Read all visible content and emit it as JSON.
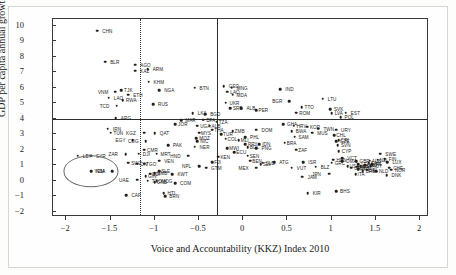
{
  "chart_data": {
    "type": "scatter",
    "title": "",
    "xlabel": "Voice and Accountability (KKZ) Index 2010",
    "ylabel": "GDP per capita annual growth (%), 2000–11",
    "xlim": [
      -2.15,
      2.1
    ],
    "ylim": [
      -2.35,
      10.45
    ],
    "xticks": [
      -2,
      -1.5,
      -1,
      -0.5,
      0,
      0.5,
      1,
      1.5,
      2
    ],
    "xticklabels": [
      "−2",
      "−1.5",
      "−1",
      "−0.5",
      "0",
      "0.5",
      "1",
      "1.5",
      "2"
    ],
    "yticks": [
      10,
      9,
      8,
      7,
      6,
      5,
      4,
      3,
      2,
      1,
      0,
      -1,
      -2
    ],
    "yticklabels": [
      "10",
      "9",
      "8",
      "7",
      "6",
      "5",
      "4",
      "3",
      "2",
      "1",
      "0",
      "−1",
      "−2"
    ],
    "grid": false,
    "legend": null,
    "reference_lines": [
      {
        "name": "growth-threshold-line",
        "orientation": "horizontal",
        "value": 4,
        "style": "solid"
      },
      {
        "name": "voice-index-line",
        "orientation": "vertical",
        "value": -0.3,
        "style": "solid"
      },
      {
        "name": "voice-index-lower-line",
        "orientation": "vertical",
        "value": -1.17,
        "style": "dotted"
      }
    ],
    "highlight": {
      "name": "KSA",
      "x": -1.72,
      "y": 0.6,
      "rx": 0.3,
      "ry": 0.95,
      "color": "#6a6a6a"
    },
    "points": [
      {
        "code": "CHN",
        "x": -1.65,
        "y": 9.7,
        "lx": 5
      },
      {
        "code": "BLR",
        "x": -1.56,
        "y": 7.7,
        "lx": 5
      },
      {
        "code": "AGO",
        "x": -1.22,
        "y": 7.5,
        "lx": 5
      },
      {
        "code": "KAZ",
        "x": -1.22,
        "y": 7.1,
        "lx": 5
      },
      {
        "code": "ARM",
        "x": -1.08,
        "y": 7.2,
        "lx": 5
      },
      {
        "code": "KHM",
        "x": -1.07,
        "y": 6.4,
        "lx": 5
      },
      {
        "code": "NGA",
        "x": -0.95,
        "y": 5.85,
        "lx": 5
      },
      {
        "code": "BTN",
        "x": -0.55,
        "y": 6.0,
        "lx": 5
      },
      {
        "code": "GEO",
        "x": -0.22,
        "y": 6.1,
        "lx": 5
      },
      {
        "code": "MNG",
        "x": -0.13,
        "y": 6.0,
        "lx": 5
      },
      {
        "code": "LAO_B",
        "label": "LAO",
        "x": -1.52,
        "y": 5.35,
        "lx": 5
      },
      {
        "code": "VNM",
        "x": -1.45,
        "y": 5.75,
        "lx": -17
      },
      {
        "code": "TJK",
        "x": -1.38,
        "y": 5.85,
        "lx": 3
      },
      {
        "code": "ETH",
        "x": -1.3,
        "y": 5.55,
        "lx": 5
      },
      {
        "code": "RWA",
        "x": -1.36,
        "y": 5.2,
        "lx": 3
      },
      {
        "code": "TCD",
        "x": -1.43,
        "y": 4.85,
        "lx": -17
      },
      {
        "code": "RUS",
        "x": -1.02,
        "y": 4.95,
        "lx": 5
      },
      {
        "code": "LAO2",
        "label": "LAO",
        "x": -0.18,
        "y": 5.75,
        "lx": 3
      },
      {
        "code": "MDA",
        "x": -0.12,
        "y": 5.55,
        "lx": 4
      },
      {
        "code": "IND",
        "x": 0.42,
        "y": 5.9,
        "lx": 5
      },
      {
        "code": "LTU",
        "x": 0.9,
        "y": 5.3,
        "lx": 5
      },
      {
        "code": "UKR",
        "x": -0.2,
        "y": 5.05,
        "lx": 4
      },
      {
        "code": "BGR",
        "x": 0.52,
        "y": 5.15,
        "lx": -17
      },
      {
        "code": "SRB",
        "x": -0.15,
        "y": 4.7,
        "lx": 3
      },
      {
        "code": "ALB",
        "x": -0.02,
        "y": 4.7,
        "lx": 5
      },
      {
        "code": "TTO",
        "x": 0.66,
        "y": 4.75,
        "lx": 3
      },
      {
        "code": "SVK",
        "x": 0.98,
        "y": 4.6,
        "lx": 4
      },
      {
        "code": "EST",
        "x": 1.16,
        "y": 4.4,
        "lx": 5
      },
      {
        "code": "LKA",
        "x": -0.57,
        "y": 4.35,
        "lx": 5
      },
      {
        "code": "BGD",
        "x": -0.43,
        "y": 4.3,
        "lx": 5
      },
      {
        "code": "LVA",
        "x": 1.0,
        "y": 4.35,
        "lx": 3
      },
      {
        "code": "ROM",
        "x": 0.6,
        "y": 4.4,
        "lx": 3
      },
      {
        "code": "ARG",
        "x": -1.44,
        "y": 4.05,
        "lx": 5
      },
      {
        "code": "MAR",
        "x": -0.7,
        "y": 3.9,
        "lx": 4
      },
      {
        "code": "BFA",
        "x": -0.45,
        "y": 3.95,
        "lx": 3
      },
      {
        "code": "POL",
        "x": 1.1,
        "y": 4.1,
        "lx": 4
      },
      {
        "code": "JOR",
        "x": -0.77,
        "y": 3.65,
        "lx": 3
      },
      {
        "code": "UGA",
        "x": -0.52,
        "y": 3.55,
        "lx": 3
      },
      {
        "code": "ALB2",
        "label": "ALB",
        "x": -0.38,
        "y": 3.55,
        "lx": 2
      },
      {
        "code": "IRN",
        "x": -1.53,
        "y": 3.35,
        "lx": 5
      },
      {
        "code": "TUN",
        "x": -1.5,
        "y": 3.1,
        "lx": 3
      },
      {
        "code": "KGZ",
        "x": -1.12,
        "y": 3.1,
        "lx": -18
      },
      {
        "code": "QAT",
        "x": -1.0,
        "y": 3.05,
        "lx": 5
      },
      {
        "code": "EGY",
        "x": -1.25,
        "y": 2.6,
        "lx": -17
      },
      {
        "code": "COG",
        "x": -1.1,
        "y": 2.55,
        "lx": -18
      },
      {
        "code": "PAK",
        "x": -0.85,
        "y": 2.3,
        "lx": 5
      },
      {
        "code": "GHA",
        "x": 0.45,
        "y": 3.65,
        "lx": 4
      },
      {
        "code": "DOM",
        "x": 0.15,
        "y": 3.3,
        "lx": 5
      },
      {
        "code": "BWA",
        "x": 0.55,
        "y": 3.2,
        "lx": 4
      },
      {
        "code": "HRV",
        "x": 0.57,
        "y": 3.55,
        "lx": 3
      },
      {
        "code": "KOR",
        "x": 0.72,
        "y": 3.5,
        "lx": 3
      },
      {
        "code": "TWN",
        "x": 0.85,
        "y": 3.35,
        "lx": 5
      },
      {
        "code": "URY",
        "x": 1.05,
        "y": 3.3,
        "lx": 5
      },
      {
        "code": "MUS",
        "x": 0.78,
        "y": 3.1,
        "lx": 5
      },
      {
        "code": "PHL",
        "x": 0.02,
        "y": 2.8,
        "lx": 5
      },
      {
        "code": "SAM",
        "x": 0.58,
        "y": 2.85,
        "lx": 4
      },
      {
        "code": "MOZ",
        "x": -0.53,
        "y": 2.75,
        "lx": 3
      },
      {
        "code": "NIC",
        "x": -0.52,
        "y": 2.55,
        "lx": 3
      },
      {
        "code": "NER",
        "x": -0.55,
        "y": 2.2,
        "lx": 5
      },
      {
        "code": "PRY",
        "x": 0.02,
        "y": 2.35,
        "lx": 3
      },
      {
        "code": "IDN",
        "x": 0.18,
        "y": 2.35,
        "lx": 3
      },
      {
        "code": "PNG",
        "x": 0.15,
        "y": 2.1,
        "lx": 5
      },
      {
        "code": "DJI",
        "x": -1.18,
        "y": 1.75,
        "lx": 4
      },
      {
        "code": "MRT",
        "x": -0.98,
        "y": 1.75,
        "lx": 4
      },
      {
        "code": "CMR",
        "x": -1.12,
        "y": 2.0,
        "lx": 3
      },
      {
        "code": "ZAR",
        "x": -1.33,
        "y": 1.7,
        "lx": -17
      },
      {
        "code": "LBY",
        "x": -1.87,
        "y": 1.6,
        "lx": 5
      },
      {
        "code": "SYR",
        "x": -1.72,
        "y": 1.6,
        "lx": 5
      },
      {
        "code": "VEN",
        "x": -0.95,
        "y": 1.3,
        "lx": 5
      },
      {
        "code": "HND",
        "x": -0.62,
        "y": 1.6,
        "lx": -18
      },
      {
        "code": "SWZ",
        "x": -1.3,
        "y": 1.15,
        "lx": 3
      },
      {
        "code": "CIV",
        "x": -1.2,
        "y": 1.1,
        "lx": 3
      },
      {
        "code": "TGO2",
        "label": "TGO",
        "x": -1.12,
        "y": 1.1,
        "lx": 2
      },
      {
        "code": "GBR",
        "x": 1.28,
        "y": 1.25,
        "lx": 3
      },
      {
        "code": "SWE",
        "x": 1.55,
        "y": 1.75,
        "lx": 5
      },
      {
        "code": "FIN",
        "x": 1.6,
        "y": 1.4,
        "lx": 4
      },
      {
        "code": "LUX",
        "x": 1.63,
        "y": 1.2,
        "lx": 5
      },
      {
        "code": "CHE",
        "x": 1.65,
        "y": 0.85,
        "lx": 4
      },
      {
        "code": "NOR",
        "x": 1.67,
        "y": 0.7,
        "lx": 4
      },
      {
        "code": "DNK",
        "x": 1.62,
        "y": 0.35,
        "lx": 5
      },
      {
        "code": "NLD",
        "x": 1.5,
        "y": 0.6,
        "lx": 3
      },
      {
        "code": "VCT",
        "x": 1.12,
        "y": 1.45,
        "lx": 5
      },
      {
        "code": "DMA",
        "x": 1.12,
        "y": 1.25,
        "lx": 4
      },
      {
        "code": "HUN",
        "x": 1.02,
        "y": 1.35,
        "lx": 3
      },
      {
        "code": "CZE",
        "x": 1.05,
        "y": 2.55,
        "lx": 4
      },
      {
        "code": "SVN",
        "x": 1.07,
        "y": 2.3,
        "lx": 3
      },
      {
        "code": "CYP",
        "x": 1.08,
        "y": 1.9,
        "lx": 3
      },
      {
        "code": "GRC",
        "x": 1.0,
        "y": 1.15,
        "lx": 3
      },
      {
        "code": "LCA",
        "x": 1.3,
        "y": 1.05,
        "lx": 3
      },
      {
        "code": "ISR",
        "x": 0.68,
        "y": 1.2,
        "lx": 5
      },
      {
        "code": "SLB",
        "x": 0.22,
        "y": 1.15,
        "lx": 3
      },
      {
        "code": "ATG",
        "x": 0.35,
        "y": 1.2,
        "lx": 5
      },
      {
        "code": "MEX",
        "x": 0.15,
        "y": 0.85,
        "lx": -18
      },
      {
        "code": "VUT",
        "x": 0.55,
        "y": 0.85,
        "lx": 5
      },
      {
        "code": "BLZ",
        "x": 0.82,
        "y": 0.9,
        "lx": 5
      },
      {
        "code": "JPN",
        "x": 0.97,
        "y": 0.45,
        "lx": -17
      },
      {
        "code": "JAM",
        "x": 0.67,
        "y": 0.25,
        "lx": 5
      },
      {
        "code": "YEM",
        "x": -1.48,
        "y": 0.6,
        "lx": -18
      },
      {
        "code": "KSA",
        "x": -1.72,
        "y": 0.6,
        "lx": 5
      },
      {
        "code": "UAE",
        "x": -1.2,
        "y": 0.05,
        "lx": -18
      },
      {
        "code": "TGO",
        "x": -1.08,
        "y": 0.0,
        "lx": 4
      },
      {
        "code": "MDG",
        "x": -0.98,
        "y": 0.0,
        "lx": 5
      },
      {
        "code": "COM",
        "x": -0.77,
        "y": -0.15,
        "lx": 5
      },
      {
        "code": "KWT",
        "x": -0.8,
        "y": 0.4,
        "lx": 5
      },
      {
        "code": "GTM",
        "x": -0.42,
        "y": 0.85,
        "lx": 5
      },
      {
        "code": "NPL",
        "x": -0.5,
        "y": 0.95,
        "lx": -17
      },
      {
        "code": "GRD",
        "x": 1.22,
        "y": 0.85,
        "lx": 3
      },
      {
        "code": "BRB",
        "x": 1.35,
        "y": 0.6,
        "lx": 3
      },
      {
        "code": "BHS",
        "x": 1.05,
        "y": -0.7,
        "lx": 4
      },
      {
        "code": "KIR",
        "x": 0.73,
        "y": -0.8,
        "lx": 5
      },
      {
        "code": "CAF",
        "x": -1.32,
        "y": -0.95,
        "lx": 5
      },
      {
        "code": "HTI",
        "x": -0.9,
        "y": -0.8,
        "lx": 4
      },
      {
        "code": "BRN",
        "x": -0.88,
        "y": -1.0,
        "lx": 4
      },
      {
        "code": "PRT",
        "x": 1.3,
        "y": 0.75,
        "lx": 2
      },
      {
        "code": "ITA",
        "x": 1.27,
        "y": 0.4,
        "lx": 2
      },
      {
        "code": "ESP",
        "x": 1.33,
        "y": 0.95,
        "lx": 2
      },
      {
        "code": "FRA",
        "x": 1.29,
        "y": 0.9,
        "lx": 2
      },
      {
        "code": "DEU",
        "x": 1.38,
        "y": 1.0,
        "lx": 2
      },
      {
        "code": "AUT",
        "x": 1.44,
        "y": 0.95,
        "lx": 2
      },
      {
        "code": "BEL",
        "x": 1.4,
        "y": 0.7,
        "lx": 2
      },
      {
        "code": "IRL",
        "x": 1.46,
        "y": 1.05,
        "lx": 2
      },
      {
        "code": "AUS",
        "x": 1.43,
        "y": 1.3,
        "lx": 2
      },
      {
        "code": "NZL",
        "x": 1.52,
        "y": 1.35,
        "lx": 2
      },
      {
        "code": "CAN",
        "x": 1.42,
        "y": 1.15,
        "lx": 2
      },
      {
        "code": "USA",
        "x": 1.18,
        "y": 0.95,
        "lx": 2
      },
      {
        "code": "CHL",
        "x": 1.03,
        "y": 2.95,
        "lx": 2
      },
      {
        "code": "CRI",
        "x": 1.08,
        "y": 2.6,
        "lx": 2
      },
      {
        "code": "ZAF",
        "x": 0.6,
        "y": 2.0,
        "lx": 2
      },
      {
        "code": "BRA",
        "x": 0.47,
        "y": 2.45,
        "lx": 2
      },
      {
        "code": "PER",
        "x": 0.15,
        "y": 4.55,
        "lx": 2
      },
      {
        "code": "COL",
        "x": -0.2,
        "y": 2.7,
        "lx": 2
      },
      {
        "code": "THA",
        "x": -0.35,
        "y": 3.3,
        "lx": 2
      },
      {
        "code": "TUR",
        "x": -0.25,
        "y": 3.0,
        "lx": 2
      },
      {
        "code": "MYS",
        "x": -0.5,
        "y": 3.1,
        "lx": 2
      },
      {
        "code": "MLI",
        "x": -0.05,
        "y": 2.6,
        "lx": 2
      },
      {
        "code": "SEN",
        "x": 0.05,
        "y": 1.6,
        "lx": 2
      },
      {
        "code": "BEN",
        "x": 0.08,
        "y": 1.3,
        "lx": 2
      },
      {
        "code": "ZMB",
        "x": -0.12,
        "y": 3.2,
        "lx": 2
      },
      {
        "code": "TZA",
        "x": -0.3,
        "y": 3.8,
        "lx": 2
      },
      {
        "code": "KEN",
        "x": -0.28,
        "y": 1.55,
        "lx": 2
      },
      {
        "code": "MWI",
        "x": -0.18,
        "y": 2.1,
        "lx": 2
      },
      {
        "code": "ECU",
        "x": -0.1,
        "y": 1.85,
        "lx": 2
      },
      {
        "code": "BOL",
        "x": 0.05,
        "y": 2.15,
        "lx": 2
      },
      {
        "code": "SLV",
        "x": 0.2,
        "y": 1.05,
        "lx": 2
      },
      {
        "code": "FJI",
        "x": -0.35,
        "y": 1.2,
        "lx": 2
      },
      {
        "code": "GMB",
        "x": -1.0,
        "y": 0.5,
        "lx": 2
      },
      {
        "code": "GIN",
        "x": -1.1,
        "y": 0.3,
        "lx": 2
      },
      {
        "code": "SLE",
        "x": -0.95,
        "y": 0.6,
        "lx": 2
      },
      {
        "code": "BDI",
        "x": -1.05,
        "y": 0.45,
        "lx": 2
      },
      {
        "code": "GNB",
        "x": -1.0,
        "y": -0.1,
        "lx": 2
      }
    ]
  }
}
